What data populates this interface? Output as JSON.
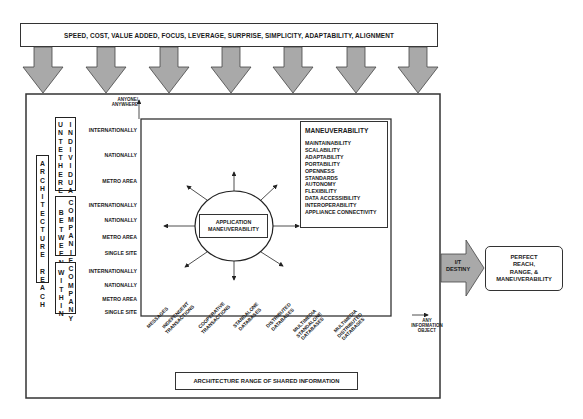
{
  "banner": {
    "text": "SPEED, COST, VALUE ADDED, FOCUS, LEVERAGE, SURPRISE, SIMPLICITY, ADAPTABILITY, ALIGNMENT",
    "arrow_count": 7,
    "arrow_color": "#a9a9a9"
  },
  "reach": {
    "title_letters": [
      "A",
      "R",
      "C",
      "H",
      "I",
      "T",
      "E",
      "C",
      "T",
      "U",
      "R",
      "E",
      " ",
      "R",
      "E",
      "A",
      "C",
      "H"
    ],
    "y_axis_top_label_1": "ANYONE/",
    "y_axis_top_label_2": "ANYWHERE",
    "groups": [
      {
        "name": "untethered-individual",
        "col1": [
          "U",
          "N",
          "T",
          "E",
          "T",
          "H",
          "E",
          "R",
          "E",
          "D"
        ],
        "col2": [
          "I",
          "N",
          "D",
          "I",
          "V",
          "I",
          "D",
          "U",
          "A",
          "L"
        ],
        "levels": [
          "INTERNATIONALLY",
          "NATIONALLY",
          "METRO AREA"
        ]
      },
      {
        "name": "between-companies",
        "col1": [
          "B",
          "E",
          "T",
          "W",
          "E",
          "E",
          "N"
        ],
        "col2": [
          "C",
          "O",
          "M",
          "P",
          "A",
          "N",
          "I",
          "E",
          "S"
        ],
        "levels": [
          "INTERNATIONALLY",
          "NATIONALLY",
          "METRO AREA",
          "SINGLE SITE"
        ]
      },
      {
        "name": "within-company",
        "col1": [
          "W",
          "I",
          "T",
          "H",
          "I",
          "N"
        ],
        "col2": [
          "C",
          "O",
          "M",
          "P",
          "A",
          "N",
          "Y"
        ],
        "levels": [
          "INTERNATIONALLY",
          "NATIONALLY",
          "METRO AREA",
          "SINGLE SITE"
        ]
      }
    ]
  },
  "center": {
    "line1": "APPLICATION",
    "line2": "MANEUVERABILITY"
  },
  "maneuverability": {
    "title": "MANEUVERABILITY",
    "items": [
      "MAINTAINABILITY",
      "SCALABILITY",
      "ADAPTABILITY",
      "PORTABILITY",
      "OPENNESS",
      "STANDARDS",
      "AUTONOMY",
      "FLEXIBILITY",
      "DATA ACCESSIBILITY",
      "INTEROPERABILITY",
      "APPLIANCE CONNECTIVITY"
    ]
  },
  "range": {
    "categories": [
      [
        "MESSAGES"
      ],
      [
        "INDEPENDENT",
        "TRANSACTIONS"
      ],
      [
        "COOPERATIVE",
        "TRANSACTIONS"
      ],
      [
        "STANDALONE",
        "DATABASES"
      ],
      [
        "DISTRIBUTED",
        "DATABASES"
      ],
      [
        "MULTIMEDIA",
        "STANDALONE",
        "DATABASES"
      ],
      [
        "MULTIMEDIA",
        "DISTRIBUTED",
        "DATABASES"
      ]
    ],
    "x_axis_end_1": "ANY",
    "x_axis_end_2": "INFORMATION",
    "x_axis_end_3": "OBJECT",
    "title": "ARCHITECTURE RANGE OF SHARED INFORMATION"
  },
  "destiny": {
    "line1": "I/T",
    "line2": "DESTINY",
    "arrow_color": "#a9a9a9"
  },
  "outcome": {
    "line1": "PERFECT",
    "line2": "REACH,",
    "line3": "RANGE, &",
    "line4": "MANEUVERABILITY"
  }
}
